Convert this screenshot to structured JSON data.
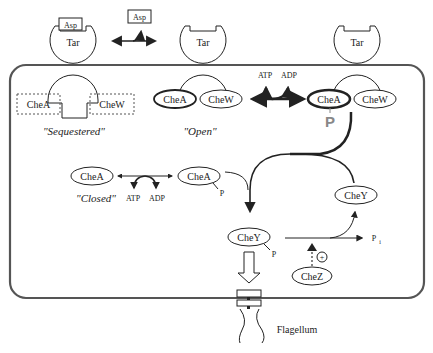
{
  "diagram": {
    "receptors": {
      "sequestered": {
        "receptor": "Tar",
        "ligand": "Asp",
        "kinase": "CheA",
        "adaptor": "CheW",
        "state_label": "\"Sequestered\""
      },
      "open": {
        "receptor": "Tar",
        "kinase": "CheA",
        "adaptor": "CheW",
        "state_label": "\"Open\""
      },
      "active": {
        "receptor": "Tar",
        "kinase": "CheA",
        "adaptor": "CheW",
        "phospho": "P"
      }
    },
    "free_ligand": "Asp",
    "open_exchange": {
      "in": "ATP",
      "out": "ADP"
    },
    "closed": {
      "kinase": "CheA",
      "state_label": "\"Closed\"",
      "in": "ATP",
      "out": "ADP"
    },
    "phospho_chea": {
      "label": "CheA",
      "sub": "P"
    },
    "chey_free": "CheY",
    "chey_p": {
      "label": "CheY",
      "sub": "P"
    },
    "phosphate": {
      "label": "P",
      "sub": "i"
    },
    "chez": {
      "label": "CheZ",
      "effect": "+"
    },
    "flagellum": "Flagellum",
    "colors": {
      "line": "#222222",
      "membrane": "#555555",
      "phospho_gray": "#888888",
      "background": "#ffffff"
    }
  }
}
